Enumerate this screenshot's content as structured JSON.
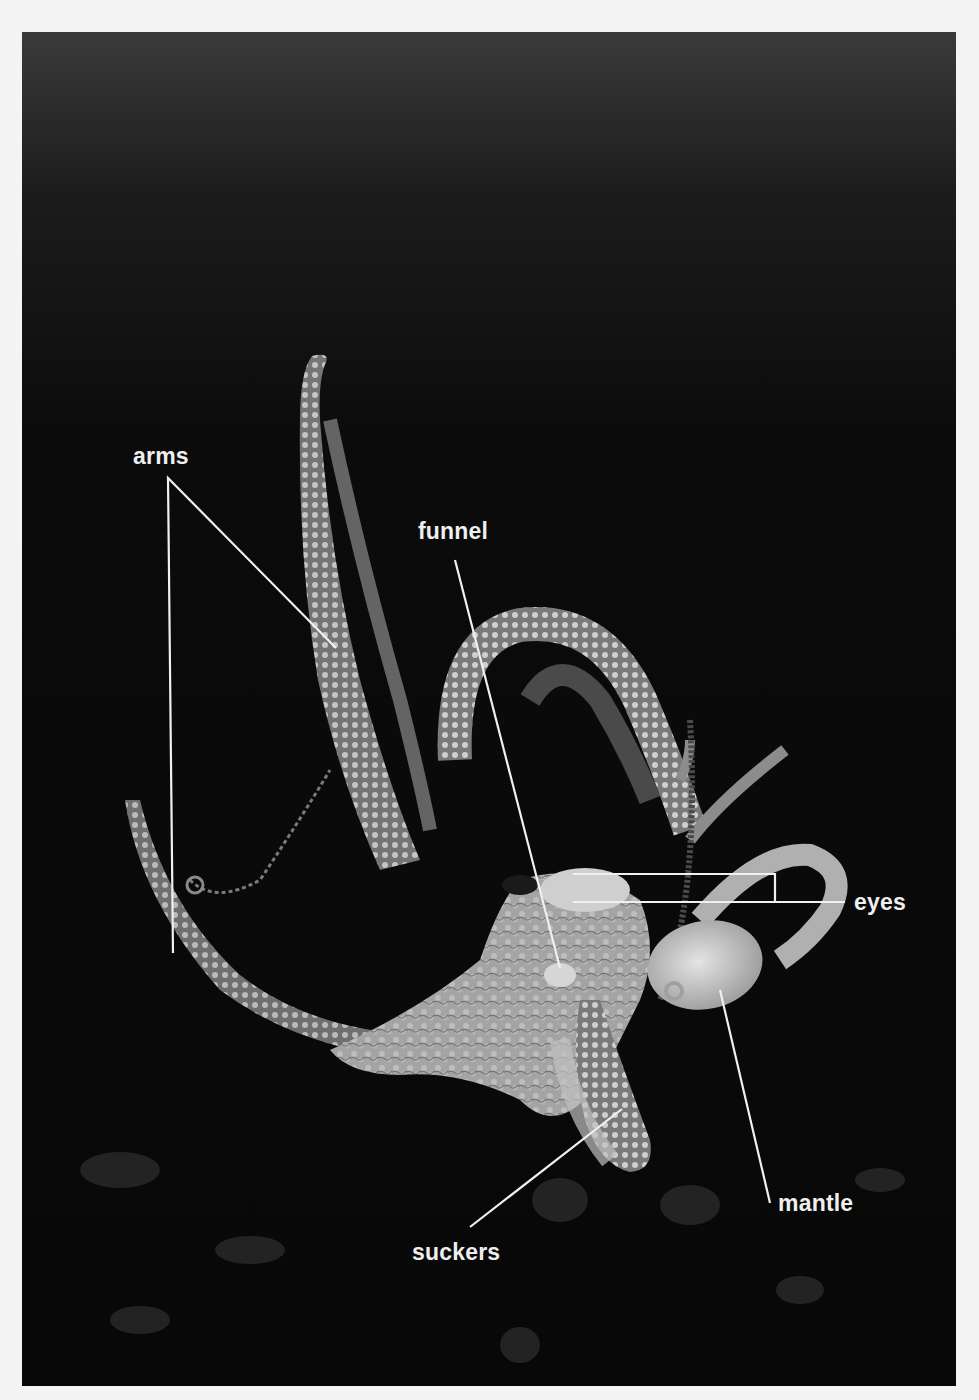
{
  "figure": {
    "background_color": "#0a0a0a",
    "page_color": "#f4f4f4",
    "label_color": "#efefef",
    "labels": [
      {
        "id": "arms",
        "text": "arms"
      },
      {
        "id": "funnel",
        "text": "funnel"
      },
      {
        "id": "eyes",
        "text": "eyes"
      },
      {
        "id": "mantle",
        "text": "mantle"
      },
      {
        "id": "suckers",
        "text": "suckers"
      }
    ]
  }
}
